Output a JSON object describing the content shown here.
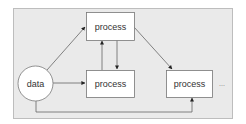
{
  "diagram": {
    "type": "flow",
    "background_color": "#eaeaea",
    "frame_color": "#bdbdbd",
    "stroke_color": "#555555",
    "nodes": [
      {
        "id": "data",
        "shape": "circle",
        "label": "data"
      },
      {
        "id": "process_top",
        "shape": "rect",
        "label": "process"
      },
      {
        "id": "process_middle",
        "shape": "rect",
        "label": "process"
      },
      {
        "id": "process_right",
        "shape": "rect",
        "label": "process"
      }
    ],
    "continuation": "...",
    "edges": [
      {
        "from": "data",
        "to": "process_top"
      },
      {
        "from": "data",
        "to": "process_middle"
      },
      {
        "from": "data",
        "to": "process_right",
        "route": "bottom"
      },
      {
        "from": "process_middle",
        "to": "process_top"
      },
      {
        "from": "process_top",
        "to": "process_middle"
      },
      {
        "from": "process_top",
        "to": "process_right"
      }
    ]
  }
}
